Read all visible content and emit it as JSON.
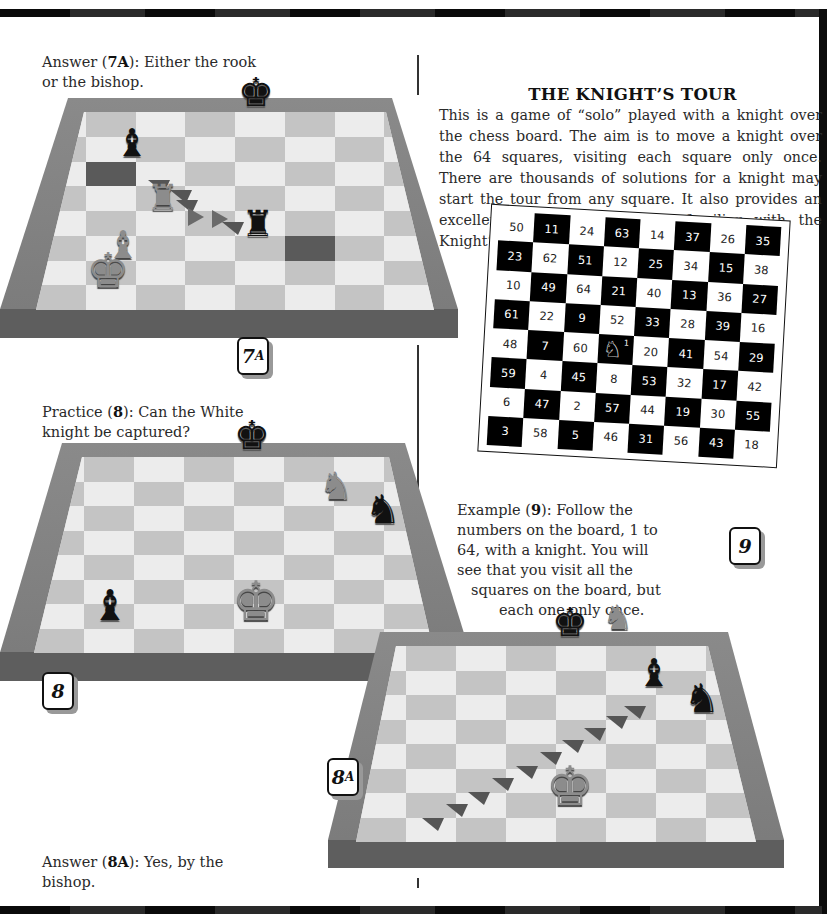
{
  "page": {
    "colors": {
      "frame": "#0c0c0c",
      "board_light": "#ececec",
      "board_dark": "#c4c4c4",
      "board_border": "#808080",
      "text": "#2a2a2a"
    }
  },
  "diagram_7a": {
    "caption_prefix": "Answer (",
    "caption_id": "7A",
    "caption_rest": "): Either the rook",
    "caption_line2": "or the bishop.",
    "label_num": "7",
    "label_sub": "A",
    "pieces": [
      {
        "name": "black-king",
        "glyph": "♚",
        "color": "black"
      },
      {
        "name": "black-bishop",
        "glyph": "♝",
        "color": "black"
      },
      {
        "name": "white-rook",
        "glyph": "♜",
        "color": "white"
      },
      {
        "name": "black-rook",
        "glyph": "♜",
        "color": "black"
      },
      {
        "name": "white-bishop",
        "glyph": "♝",
        "color": "white"
      },
      {
        "name": "white-king",
        "glyph": "♚",
        "color": "white"
      }
    ]
  },
  "diagram_8": {
    "caption_prefix": "Practice (",
    "caption_id": "8",
    "caption_rest": "): Can the White",
    "caption_line2": "knight be captured?",
    "label_num": "8",
    "pieces": [
      {
        "name": "black-king",
        "glyph": "♚",
        "color": "black"
      },
      {
        "name": "white-knight",
        "glyph": "♞",
        "color": "white"
      },
      {
        "name": "black-knight",
        "glyph": "♞",
        "color": "black"
      },
      {
        "name": "black-bishop",
        "glyph": "♝",
        "color": "black"
      },
      {
        "name": "white-king",
        "glyph": "♚",
        "color": "white"
      }
    ]
  },
  "diagram_8a": {
    "caption_prefix": "Answer (",
    "caption_id": "8A",
    "caption_rest": "): Yes, by the",
    "caption_line2": "bishop.",
    "label_num": "8",
    "label_sub": "A",
    "pieces": [
      {
        "name": "black-king",
        "glyph": "♚",
        "color": "black"
      },
      {
        "name": "white-knight-captured",
        "glyph": "♞",
        "color": "white"
      },
      {
        "name": "black-bishop",
        "glyph": "♝",
        "color": "black"
      },
      {
        "name": "black-knight",
        "glyph": "♞",
        "color": "black"
      },
      {
        "name": "white-king",
        "glyph": "♚",
        "color": "white"
      }
    ]
  },
  "knights_tour": {
    "title": "THE KNIGHT’S TOUR",
    "intro": "This is a game of “solo” played with a knight over the chess board. The aim is to move a knight over the 64 squares, visiting each square only once. There are thousands of solutions for a knight may start the tour from any square. It also provides an excellent exercise to become familiar with the Knight’s move.",
    "start_marker": "1",
    "knight_glyph": "♘",
    "grid": [
      [
        50,
        11,
        24,
        63,
        14,
        37,
        26,
        35
      ],
      [
        23,
        62,
        51,
        12,
        25,
        34,
        15,
        38
      ],
      [
        10,
        49,
        64,
        21,
        40,
        13,
        36,
        27
      ],
      [
        61,
        22,
        9,
        52,
        33,
        28,
        39,
        16
      ],
      [
        48,
        7,
        60,
        1,
        20,
        41,
        54,
        29
      ],
      [
        59,
        4,
        45,
        8,
        53,
        32,
        17,
        42
      ],
      [
        6,
        47,
        2,
        57,
        44,
        19,
        30,
        55
      ],
      [
        3,
        58,
        5,
        46,
        31,
        56,
        43,
        18
      ]
    ]
  },
  "example_9": {
    "caption_prefix": "Example (",
    "caption_id": "9",
    "lines": [
      "): Follow the",
      "numbers on the board, 1 to",
      "64, with a knight. You will",
      "see that you visit all the",
      "squares on the board, but",
      "each one only once."
    ],
    "label_num": "9"
  }
}
